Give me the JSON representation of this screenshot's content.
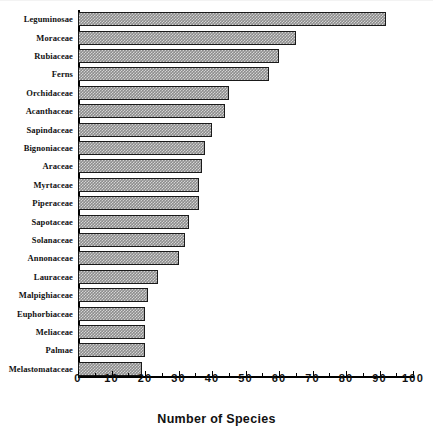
{
  "chart_data": {
    "type": "bar",
    "orientation": "horizontal",
    "title": "",
    "xlabel": "Number of Species",
    "ylabel": "",
    "xlim": [
      0,
      100
    ],
    "xticks": [
      0,
      10,
      20,
      30,
      40,
      50,
      60,
      70,
      80,
      90,
      100
    ],
    "xtick_labels": [
      "0",
      "10",
      "20",
      "30",
      "40",
      "50",
      "60",
      "70",
      "80",
      "90",
      "100"
    ],
    "minor_tick_step": 5,
    "grid": false,
    "legend": null,
    "bar_fill_color": "#8d8d8d",
    "bar_edge_color": "#1a1a1a",
    "bar_pattern": "fine-checker-hatch",
    "categories": [
      "Leguminosae",
      "Moraceae",
      "Rubiaceae",
      "Ferns",
      "Orchidaceae",
      "Acanthaceae",
      "Sapindaceae",
      "Bignoniaceae",
      "Araceae",
      "Myrtaceae",
      "Piperaceae",
      "Sapotaceae",
      "Solanaceae",
      "Annonaceae",
      "Lauraceae",
      "Malpighiaceae",
      "Euphorbiaceae",
      "Meliaceae",
      "Palmae",
      "Melastomataceae"
    ],
    "values": [
      92,
      65,
      60,
      57,
      45,
      44,
      40,
      38,
      37,
      36,
      36,
      33,
      32,
      30,
      24,
      21,
      20,
      20,
      20,
      19
    ]
  }
}
